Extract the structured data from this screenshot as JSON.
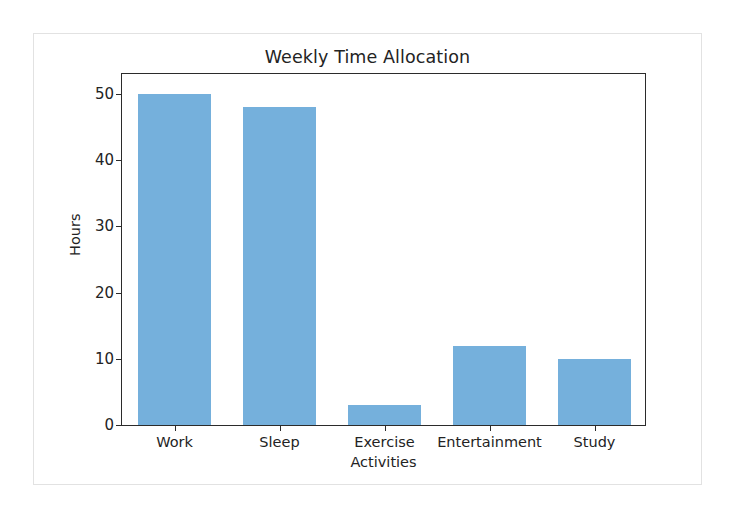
{
  "chart_data": {
    "type": "bar",
    "title": "Weekly Time Allocation",
    "xlabel": "Activities",
    "ylabel": "Hours",
    "categories": [
      "Work",
      "Sleep",
      "Exercise",
      "Entertainment",
      "Study"
    ],
    "values": [
      50,
      48,
      3,
      12,
      10
    ],
    "ylim": [
      0,
      50
    ],
    "yticks": [
      0,
      10,
      20,
      30,
      40,
      50
    ],
    "ytick_labels": [
      "0",
      "10",
      "20",
      "30",
      "40",
      "50"
    ],
    "grid": false,
    "legend": false,
    "bar_color": "#75b0dc",
    "axis_color": "#2b2b2b",
    "background_color": "#ffffff"
  }
}
